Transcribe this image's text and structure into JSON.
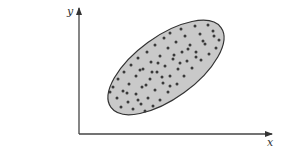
{
  "diagram": {
    "type": "scatter-region",
    "axes": {
      "x_label": "x",
      "y_label": "y",
      "origin": [
        79,
        134
      ],
      "x_end": 272,
      "y_end": 8
    },
    "region": {
      "shape": "ellipse",
      "center": [
        166,
        67.5
      ],
      "rx": 68,
      "ry": 31,
      "rotation_deg": -36,
      "fill": "#c9c9c9",
      "stroke": "#333333"
    },
    "points_color": "#3a3a3a",
    "point_count": 70
  },
  "chart_data": {
    "type": "scatter",
    "title": "",
    "xlabel": "x",
    "ylabel": "y",
    "grid": false,
    "legend": "none",
    "annotations": [
      "Points fill a tilted ellipse — positive correlation"
    ],
    "points": [
      [
        195,
        26
      ],
      [
        208,
        25
      ],
      [
        181,
        29
      ],
      [
        170,
        33
      ],
      [
        185,
        36
      ],
      [
        200,
        34
      ],
      [
        213,
        31
      ],
      [
        219,
        40
      ],
      [
        164,
        38
      ],
      [
        176,
        42
      ],
      [
        190,
        45
      ],
      [
        205,
        44
      ],
      [
        216,
        48
      ],
      [
        155,
        45
      ],
      [
        168,
        48
      ],
      [
        182,
        52
      ],
      [
        196,
        52
      ],
      [
        209,
        54
      ],
      [
        147,
        52
      ],
      [
        160,
        56
      ],
      [
        173,
        59
      ],
      [
        187,
        61
      ],
      [
        201,
        60
      ],
      [
        138,
        58
      ],
      [
        151,
        62
      ],
      [
        165,
        66
      ],
      [
        178,
        69
      ],
      [
        192,
        68
      ],
      [
        131,
        65
      ],
      [
        143,
        69
      ],
      [
        157,
        72
      ],
      [
        170,
        76
      ],
      [
        184,
        76
      ],
      [
        124,
        72
      ],
      [
        136,
        76
      ],
      [
        150,
        79
      ],
      [
        163,
        83
      ],
      [
        177,
        84
      ],
      [
        118,
        79
      ],
      [
        129,
        84
      ],
      [
        142,
        87
      ],
      [
        155,
        90
      ],
      [
        168,
        92
      ],
      [
        113,
        87
      ],
      [
        123,
        91
      ],
      [
        136,
        94
      ],
      [
        148,
        98
      ],
      [
        160,
        100
      ],
      [
        117,
        98
      ],
      [
        128,
        102
      ],
      [
        141,
        104
      ],
      [
        153,
        106
      ],
      [
        121,
        107
      ],
      [
        133,
        109
      ],
      [
        145,
        111
      ],
      [
        140,
        70
      ],
      [
        158,
        63
      ],
      [
        174,
        55
      ],
      [
        188,
        49
      ],
      [
        203,
        41
      ],
      [
        127,
        93
      ],
      [
        146,
        85
      ],
      [
        162,
        77
      ],
      [
        180,
        63
      ],
      [
        196,
        57
      ],
      [
        110,
        92
      ],
      [
        138,
        100
      ],
      [
        214,
        36
      ],
      [
        170,
        86
      ],
      [
        152,
        72
      ]
    ]
  }
}
